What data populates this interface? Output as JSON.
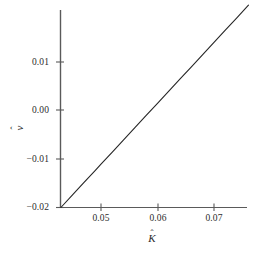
{
  "figure": {
    "background_color": "#ffffff",
    "line_color": "#262626",
    "axis_color": "#5a5a5a"
  },
  "axes": {
    "x": {
      "title_base": "K",
      "title_hat": "ˆ",
      "title": "K̂",
      "ticks": [
        "0.05",
        "0.06",
        "0.07"
      ],
      "tick_values": [
        0.05,
        0.06,
        0.07
      ],
      "range": [
        0.0429,
        0.0761
      ]
    },
    "y": {
      "title_base": "v",
      "title_hat": "ˆ",
      "title": "v̂",
      "ticks": [
        "0.01",
        "0.00",
        "−0.01",
        "−0.02"
      ],
      "tick_values": [
        0.01,
        0.0,
        -0.01,
        -0.02
      ],
      "range": [
        -0.0205,
        0.0215
      ]
    }
  },
  "chart_data": {
    "type": "line",
    "title": "",
    "subtitle": "",
    "xlabel": "K̂",
    "ylabel": "v̂",
    "xlim": [
      0.0429,
      0.0761
    ],
    "ylim": [
      -0.0205,
      0.0215
    ],
    "xticks": [
      0.05,
      0.06,
      0.07
    ],
    "xticklabels": [
      "0.05",
      "0.06",
      "0.07"
    ],
    "yticks": [
      0.01,
      0.0,
      -0.01,
      -0.02
    ],
    "yticklabels": [
      "0.01",
      "0.00",
      "−0.01",
      "−0.02"
    ],
    "grid": false,
    "legend": null,
    "legend_position": "none",
    "annotations": [],
    "series": [
      {
        "name": "v̂ vs K̂",
        "color": "#262626",
        "linewidth": 1.1,
        "x": [
          0.0429,
          0.045,
          0.047,
          0.049,
          0.05,
          0.052,
          0.054,
          0.056,
          0.058,
          0.06,
          0.062,
          0.064,
          0.066,
          0.068,
          0.07,
          0.072,
          0.074,
          0.0761
        ],
        "y": [
          -0.02,
          -0.01737,
          -0.01487,
          -0.01237,
          -0.01112,
          -0.00862,
          -0.00612,
          -0.00362,
          -0.00112,
          0.00138,
          0.00388,
          0.00637,
          0.00887,
          0.01137,
          0.01387,
          0.01637,
          0.01887,
          0.0215
        ]
      }
    ]
  }
}
